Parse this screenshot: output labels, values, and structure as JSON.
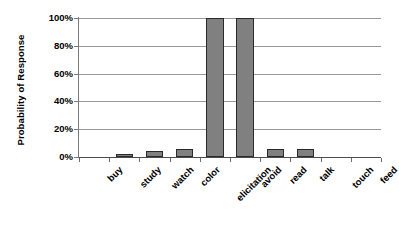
{
  "chart_data": {
    "type": "bar",
    "title": "",
    "xlabel": "",
    "ylabel": "Probability of Response",
    "categories": [
      "buy",
      "study",
      "watch",
      "color",
      "elicitation",
      "avoid",
      "read",
      "talk",
      "touch",
      "feed"
    ],
    "values": [
      0,
      2,
      4,
      6,
      100,
      100,
      6,
      6,
      0,
      0
    ],
    "ytick_labels": [
      "0%",
      "20%",
      "40%",
      "60%",
      "80%",
      "100%"
    ],
    "ytick_values": [
      0,
      20,
      40,
      60,
      80,
      100
    ],
    "ylim": [
      0,
      100
    ],
    "grid": true,
    "legend": false,
    "bar_color": "#808080",
    "bar_edge_color": "#2a2a2a",
    "gridline_color": "#9a9a9a",
    "axis_color": "#4d4d4d",
    "background": "#ffffff"
  }
}
